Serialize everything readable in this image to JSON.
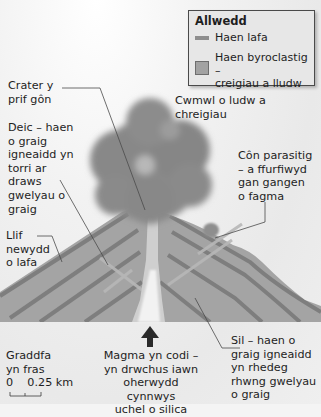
{
  "legend": {
    "title": "Allwedd",
    "items": [
      {
        "label": "Haen lafa",
        "swatch": "line",
        "color": "#8d8d8d"
      },
      {
        "label": "Haen byroclastig –\ncreigiau a lludw",
        "swatch": "box",
        "color": "#a2a2a2"
      }
    ]
  },
  "labels": {
    "crater": "Crater y\nprif gôn",
    "ash_cloud": "Cwmwl o ludw a chreigiau",
    "dyke": "Deic – haen\no graig\nigneaidd yn\ntorri ar\ndraws\ngwelyau o\ngraig",
    "parasitic_cone": "Côn parasitig\n– a ffurfiwyd\ngan gangen\no fagma",
    "lava_flow": "Llif\nnewydd\no lafa",
    "scale_title": "Graddfa\nyn fras",
    "scale_values": "0    0.25 km",
    "magma": "Magma yn codi –\nyn drwchus iawn\noherwydd cynnwys\nuchel o silica",
    "sill": "Sil – haen o\ngraig igneaidd\nyn rhedeg\nrhwng gwelyau\no graig"
  },
  "colors": {
    "cone": "#a4a4a4",
    "lava_layer": "#7e7e7e",
    "ash_cloud": "#8a8a8a",
    "vent": "#f2f2f2",
    "arrow": "#2a2a2a",
    "leader_line": "#4a4a4a"
  }
}
